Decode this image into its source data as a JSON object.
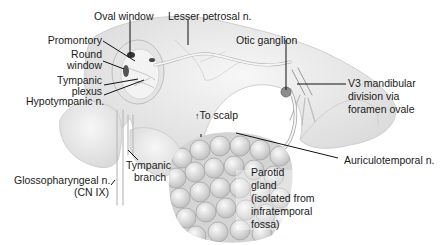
{
  "diagram": {
    "labels": {
      "oval_window": "Oval window",
      "lesser_petrosal": "Lesser petrosal n.",
      "promontory": "Promontory",
      "round_window_1": "Round",
      "round_window_2": "window",
      "tympanic_plexus_1": "Tympanic",
      "tympanic_plexus_2": "plexus",
      "hypotympanic": "Hypotympanic n.",
      "otic_ganglion": "Otic ganglion",
      "v3_1": "V3 mandibular",
      "v3_2": "division via",
      "v3_3": "foramen ovale",
      "to_scalp": "To scalp",
      "auriculotemporal": "Auriculotemporal n.",
      "glosso_1": "Glossopharyngeal n.",
      "glosso_2": "(CN IX)",
      "tympanic_branch_1": "Tympanic",
      "tympanic_branch_2": "branch",
      "parotid_1": "Parotid",
      "parotid_2": "gland",
      "parotid_3": "(isolated from",
      "parotid_4": "infratemporal",
      "parotid_5": "fossa)"
    },
    "colors": {
      "bone": "#eeeeee",
      "bone_edge": "#c8c8c8",
      "nerve": "#f4f4f4",
      "nerve_edge": "#a8a8a8",
      "ganglion": "#8c8c8c",
      "leader": "#111111",
      "gland": "#e2e2e2"
    }
  }
}
